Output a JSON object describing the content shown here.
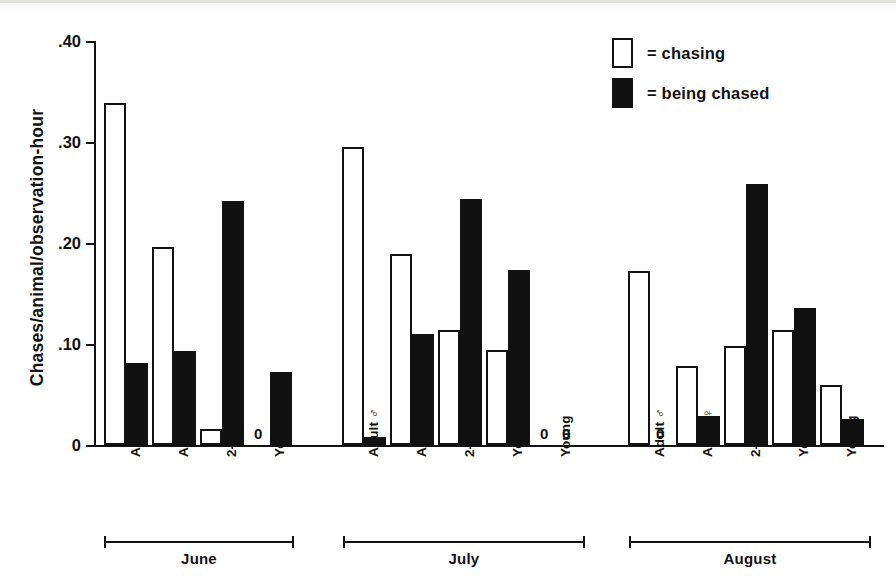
{
  "chart_data": {
    "type": "bar",
    "title": "",
    "xlabel": "",
    "ylabel": "Chases/animal/observation-hour",
    "ylim": [
      0,
      0.4
    ],
    "ytick_labels": [
      "0",
      ".10",
      ".20",
      ".30",
      ".40"
    ],
    "ytick_values": [
      0,
      0.1,
      0.2,
      0.3,
      0.4
    ],
    "grid": false,
    "legend_position": "top-right",
    "legend": [
      "= chasing",
      "= being chased"
    ],
    "series": [
      {
        "name": "chasing",
        "color": "#ffffff"
      },
      {
        "name": "being chased",
        "color": "#111111"
      }
    ],
    "groups": [
      {
        "label": "June",
        "categories": [
          {
            "label": "Adult ♂",
            "chasing": 0.339,
            "chased": 0.081,
            "chasing_zero": false,
            "chased_zero": false
          },
          {
            "label": "Adult ♀",
            "chasing": 0.196,
            "chased": 0.093,
            "chasing_zero": false,
            "chased_zero": false
          },
          {
            "label": "2-year-old",
            "chasing": 0.016,
            "chased": 0.242,
            "chasing_zero": false,
            "chased_zero": false
          },
          {
            "label": "Yearling",
            "chasing": 0.0,
            "chased": 0.072,
            "chasing_zero": true,
            "chased_zero": false
          }
        ]
      },
      {
        "label": "July",
        "categories": [
          {
            "label": "Adult ♂",
            "chasing": 0.295,
            "chased": 0.008,
            "chasing_zero": false,
            "chased_zero": false
          },
          {
            "label": "Adult ♀",
            "chasing": 0.189,
            "chased": 0.11,
            "chasing_zero": false,
            "chased_zero": false
          },
          {
            "label": "2-year-old",
            "chasing": 0.114,
            "chased": 0.244,
            "chasing_zero": false,
            "chased_zero": false
          },
          {
            "label": "Yearling",
            "chasing": 0.094,
            "chased": 0.173,
            "chasing_zero": false,
            "chased_zero": false
          },
          {
            "label": "Young",
            "chasing": 0.0,
            "chased": 0.0,
            "chasing_zero": true,
            "chased_zero": true
          }
        ]
      },
      {
        "label": "August",
        "categories": [
          {
            "label": "Adult ♂",
            "chasing": 0.172,
            "chased": 0.0,
            "chasing_zero": false,
            "chased_zero": true
          },
          {
            "label": "Adult ♀",
            "chasing": 0.078,
            "chased": 0.029,
            "chasing_zero": false,
            "chased_zero": false
          },
          {
            "label": "2-year-old",
            "chasing": 0.098,
            "chased": 0.258,
            "chasing_zero": false,
            "chased_zero": false
          },
          {
            "label": "Yearling",
            "chasing": 0.114,
            "chased": 0.136,
            "chasing_zero": false,
            "chased_zero": false
          },
          {
            "label": "Young",
            "chasing": 0.059,
            "chased": 0.026,
            "chasing_zero": false,
            "chased_zero": false
          }
        ]
      }
    ],
    "zero_label": "0"
  },
  "layout": {
    "baseline_y": 445,
    "top_y": 41,
    "value_top": 0.4,
    "axis_x": 94,
    "bar_width": 22,
    "group_starts": [
      104,
      342,
      628
    ],
    "pair_pitch": 48,
    "brackets": [
      {
        "x": 104,
        "w": 190
      },
      {
        "x": 343,
        "w": 242
      },
      {
        "x": 629,
        "w": 242
      }
    ],
    "bracket_y": 536
  }
}
